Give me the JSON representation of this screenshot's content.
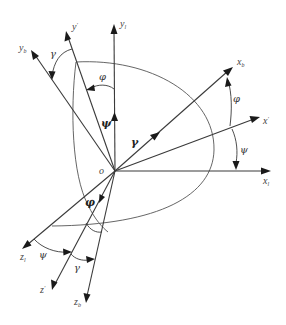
{
  "diagram": {
    "type": "coordinate-frame-rotation",
    "origin": {
      "label": "o"
    },
    "axes": {
      "y_l": {
        "base": "y",
        "sub": "l"
      },
      "y_prime": {
        "base": "y",
        "sup": "′"
      },
      "y_b": {
        "base": "y",
        "sub": "b"
      },
      "x_b": {
        "base": "x",
        "sub": "b"
      },
      "x_prime": {
        "base": "x",
        "sup": "′"
      },
      "x_l": {
        "base": "x",
        "sub": "l"
      },
      "z_l": {
        "base": "z",
        "sub": "l"
      },
      "z_prime": {
        "base": "z",
        "sup": "′"
      },
      "z_b": {
        "base": "z",
        "sub": "b"
      }
    },
    "angles": {
      "gamma_top": "γ",
      "phi_top": "φ",
      "psi_center": "ψ",
      "gamma_center": "γ",
      "phi_right": "φ",
      "psi_right": "ψ",
      "phi_bottom": "φ",
      "psi_bottom": "ψ",
      "gamma_bottom": "γ"
    },
    "colors": {
      "line": "#3a3a3a",
      "arrowhead": "#1a1a1a",
      "label": "#444444",
      "background": "#ffffff"
    }
  }
}
